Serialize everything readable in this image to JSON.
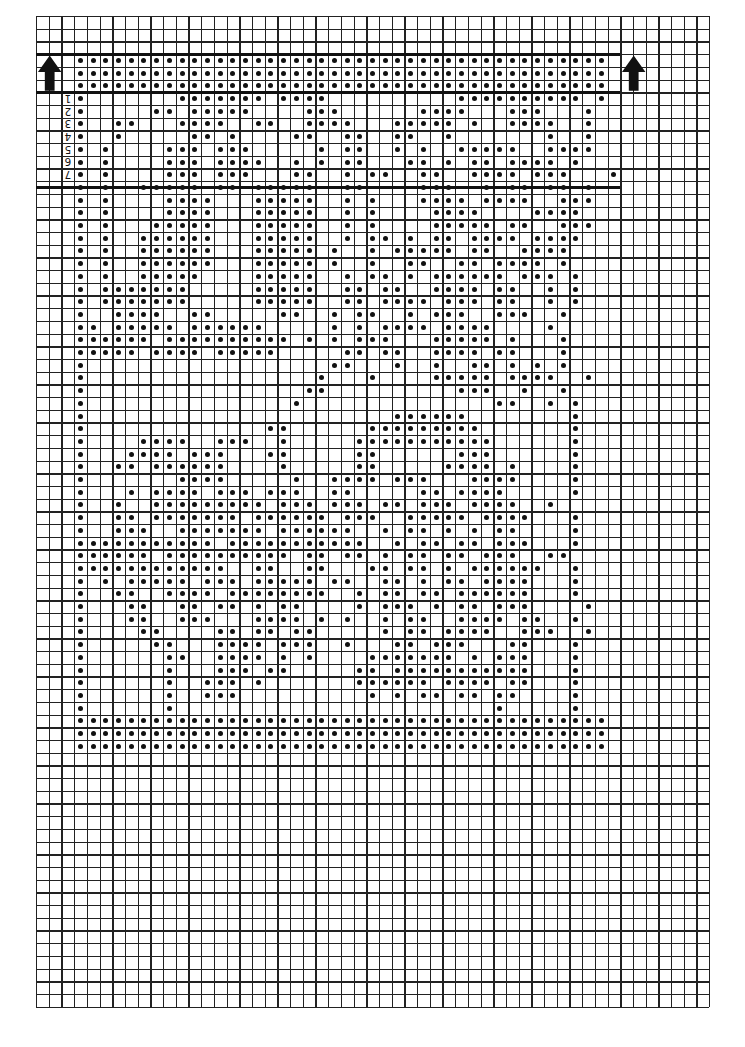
{
  "chart": {
    "cols": 53,
    "rows": 78,
    "cell_px": 12.7,
    "pattern_col_offset": 3,
    "pattern_row_offset": 3,
    "thick_lines_rows": [
      3,
      6,
      13.5
    ],
    "thick_line_extent_cols": [
      0,
      46
    ],
    "arrow_left": {
      "icon": "up-arrow-icon",
      "col": 0,
      "row": 3
    },
    "arrow_right": {
      "icon": "up-arrow-icon",
      "col": 46,
      "row": 3
    },
    "row_numbers": [
      "1",
      "2",
      "3",
      "4",
      "5",
      "6",
      "7"
    ],
    "ink_color": "#111111",
    "pattern": [
      "##########################################",
      "##########################################",
      "##########################################",
      "#.......#######.####..........##########.#",
      "#.....##.#####....###......####...###...#.",
      "#..##...####..##..####...#####.#..####..#.",
      "#..#.....##.#....##..##..##..#.......#..#.",
      "#.#....###.###.....#.##..#.#..#####..####.",
      "#.#....###.####..#.#.##...##.#.##.####.#..",
      "#.#....###.###...##..#.##..##..####.###...#",
      "#.#..#####.##.#####..##....###..#.##.##.#",
      "#.#....####...#####..#.#...####.####..###",
      "#.#....####...#####..#.#....####....####.",
      "#.#...#####...#####..#.#....#####.##..###",
      "#.#..######...#####..#.##.#.##.####.####",
      "#.#..######...#####.#..#.#####.##..####",
      "#.#..######...#####.#..#..##..##.####.#",
      "#.#..#####....#####..#.##.#.######.###.#",
      "#.#######.....#####..##.##..####.##..#.#",
      "#.#######.....#####..##.####.###.##..#.#",
      "#..####..##.....##..#.##..#.###..###..#.",
      "##.#####.######.....#.#.####.####....#.",
      "######.##########.#.#.###...#####.#...#",
      "#####.####.#####.....##.##..####.##...#",
      "#...................##...#..#..##.#.#.#",
      "#..................#...#....#####.####..#",
      "#.................##..........###..#..#.",
      "#................#...............##..#.#",
      "#........................######........#",
      "#..............##......#########.......#",
      "#....####..###..#.....###########......#",
      "#...####.###...##.....##......###......#",
      "#..##.######....#.....##.....####.#....#",
      "#.......####.....#..####.###...####....#",
      "#...#.####.###.###..##.....##.####.....#",
      "#..#..#########.###.###.##.###.####..#",
      "#..##.#######.######.###..#####.####...#",
      "#..###..#######.######..#.##.#.#.##....#",
      "###########.###########..#.##.##.###...#",
      "######.##########.##.##.#.##.##.###..##",
      "############..##..##...##.##.#.######..#",
      "#.#.#####.###.#####.##..##.#.##.####...#",
      "#..##..####.########..#.##.##.######...#",
      "#...##..##.##.#.##....#.###.#.##.###....#",
      "#...##..###...####.#.#..#.##..####.##..#",
      "#....##....##.##.##.....#.##.####..###..#",
      "#.....##...####.###..#...##.###...##...#",
      "#......##..####.#.#....#######.#.###...#",
      "#......#...###.##.....##.###########...#",
      "#......#..###.#.......######.####.##...#",
      "#......#..###..........#.#.##.##.##....#",
      "#......#.........................#.....#",
      "##########################################",
      "##########################################",
      "##########################################"
    ]
  }
}
